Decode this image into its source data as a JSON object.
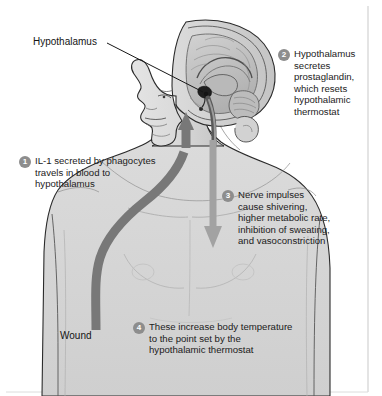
{
  "figure": {
    "width": 382,
    "height": 396,
    "background_color": "#ffffff"
  },
  "labels": {
    "hypothalamus": "Hypothalamus",
    "wound": "Wound"
  },
  "steps": [
    {
      "number": "1",
      "text": "IL-1 secreted by phagocytes\ntravels in blood to\nhypothalamus"
    },
    {
      "number": "2",
      "text": "Hypothalamus\nsecretes\nprostaglandin,\nwhich resets\nhypothalamic\nthermostat"
    },
    {
      "number": "3",
      "text": "Nerve impulses\ncause shivering,\nhigher metabolic rate,\ninhibition of sweating,\nand vasoconstriction"
    },
    {
      "number": "4",
      "text": "These increase body temperature\nto the point set by the\nhypothalamic thermostat"
    }
  ],
  "colors": {
    "badge_fill": "#8d8d8d",
    "badge_text": "#ffffff",
    "blood_arrow": "#7a7a7a",
    "nerve_arrow": "#9d9d9d",
    "body_fill": "#d8d8d8",
    "body_outline": "#2b2b2b",
    "brain_fill": "#c6c6c6",
    "text": "#1b1b1b"
  },
  "arrows": {
    "blood_vessel": "ascending blood pathway from wound to hypothalamus",
    "nerve_impulse": "descending nerve impulse pathway from brain to body"
  }
}
